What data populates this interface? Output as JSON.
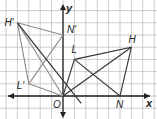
{
  "diagram": {
    "axes": {
      "x_label": "x",
      "y_label": "y",
      "origin_label": "O"
    },
    "grid": {
      "x_min": -6,
      "x_max": 8,
      "y_min": -2,
      "y_max": 8
    },
    "colors": {
      "grid": "#b8b8b8",
      "axis": "#222222",
      "original": "#333333",
      "image": "#8a8a8a"
    },
    "points": [
      {
        "label": "H",
        "x": 6,
        "y": 4
      },
      {
        "label": "N",
        "x": 5,
        "y": 0
      },
      {
        "label": "L",
        "x": 1,
        "y": 3
      },
      {
        "label": "H'",
        "x": -4,
        "y": 6
      },
      {
        "label": "N'",
        "x": 0,
        "y": 5
      },
      {
        "label": "L'",
        "x": -3,
        "y": 1
      },
      {
        "label": "O",
        "x": 0,
        "y": 0
      }
    ],
    "triangles": [
      {
        "name": "HNL",
        "vertices": [
          "H",
          "N",
          "L"
        ]
      },
      {
        "name": "H'N'L'",
        "vertices": [
          "H'",
          "N'",
          "L'"
        ]
      }
    ],
    "rays_from_origin": [
      "H",
      "L",
      "H'",
      "L'"
    ]
  }
}
